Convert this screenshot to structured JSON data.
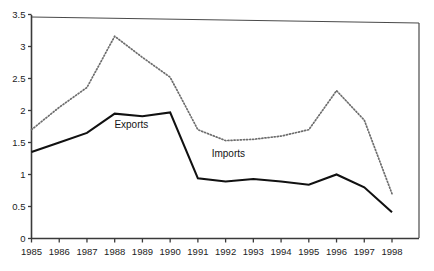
{
  "chart_data": {
    "type": "line",
    "title": "",
    "subtitle": "",
    "xlabel": "",
    "ylabel": "",
    "grid": false,
    "legend_position": "inline-annotation",
    "categories": [
      "1985",
      "1986",
      "1987",
      "1988",
      "1989",
      "1990",
      "1991",
      "1992",
      "1993",
      "1994",
      "1995",
      "1996",
      "1997",
      "1998"
    ],
    "x": [
      1985,
      1986,
      1987,
      1988,
      1989,
      1990,
      1991,
      1992,
      1993,
      1994,
      1995,
      1996,
      1997,
      1998
    ],
    "xlim": [
      1985,
      1998
    ],
    "ylim": [
      0,
      3.5
    ],
    "yticks": [
      "0",
      "0.5",
      "1",
      "1.5",
      "2",
      "2.5",
      "3",
      "3.5"
    ],
    "ytick_values": [
      0,
      0.5,
      1,
      1.5,
      2,
      2.5,
      3,
      3.5
    ],
    "series": [
      {
        "name": "Exports",
        "style": "solid",
        "color": "#111111",
        "values": [
          1.35,
          1.5,
          1.65,
          1.95,
          1.91,
          1.97,
          0.94,
          0.89,
          0.93,
          0.89,
          0.84,
          1.0,
          0.8,
          0.41
        ]
      },
      {
        "name": "Imports",
        "style": "dotted",
        "color": "#6d6d6d",
        "values": [
          1.7,
          2.05,
          2.36,
          3.16,
          2.83,
          2.52,
          1.7,
          1.53,
          1.55,
          1.6,
          1.7,
          2.31,
          1.85,
          0.7
        ]
      }
    ],
    "annotations": [
      {
        "text": "Exports",
        "x": 1988.6,
        "y": 1.72
      },
      {
        "text": "Imports",
        "x": 1992.1,
        "y": 1.28
      }
    ]
  },
  "axes": {
    "y_tick_labels": [
      "3.5",
      "3",
      "2.5",
      "2",
      "1.5",
      "1",
      "0.5",
      "0"
    ],
    "x_tick_labels": [
      "1985",
      "1986",
      "1987",
      "1988",
      "1989",
      "1990",
      "1991",
      "1992",
      "1993",
      "1994",
      "1995",
      "1996",
      "1997",
      "1998"
    ]
  }
}
